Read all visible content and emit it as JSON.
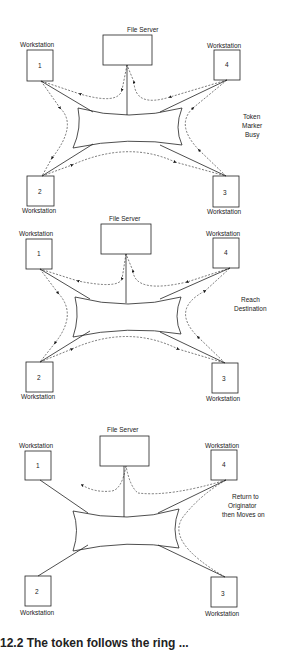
{
  "panels": [
    {
      "file_server_label": "File Server",
      "workstations": [
        {
          "label": "Workstation",
          "number": "1"
        },
        {
          "label": "Workstation",
          "number": "4"
        },
        {
          "label": "Workstation",
          "number": "2"
        },
        {
          "label": "Workstation",
          "number": "3"
        }
      ],
      "state_label": [
        "Token",
        "Marker",
        "Busy"
      ]
    },
    {
      "file_server_label": "File Server",
      "workstations": [
        {
          "label": "Workstation",
          "number": "1"
        },
        {
          "label": "Workstation",
          "number": "4"
        },
        {
          "label": "Workstation",
          "number": "2"
        },
        {
          "label": "Workstation",
          "number": "3"
        }
      ],
      "state_label": [
        "Reach",
        "Destination"
      ]
    },
    {
      "file_server_label": "File Server",
      "workstations": [
        {
          "label": "Workstation",
          "number": "1"
        },
        {
          "label": "Workstation",
          "number": "4"
        },
        {
          "label": "Workstation",
          "number": "2"
        },
        {
          "label": "Workstation",
          "number": "3"
        }
      ],
      "state_label": [
        "Return to",
        "Originator",
        "then Moves on"
      ]
    }
  ],
  "caption": "12.2 The token follows the ring ..."
}
